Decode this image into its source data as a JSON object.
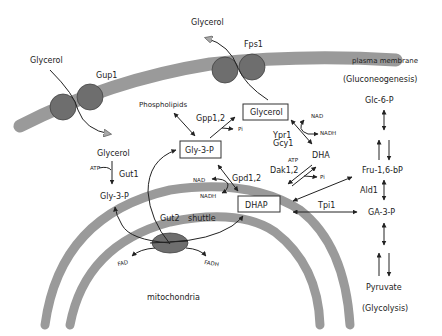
{
  "colors": {
    "membrane": "#9a9a9a",
    "protein": "#6e6e6e",
    "line": "#222222",
    "background": "#ffffff"
  },
  "labels": {
    "plasma_membrane": "plasma membrane",
    "gluconeogenesis": "(Gluconeogenesis)",
    "glycolysis": "(Glycolysis)",
    "mitochondria": "mitochondria",
    "glycerol_out_left": "Glycerol",
    "glycerol_out_top": "Glycerol",
    "glycerol_in_left": "Glycerol",
    "gup1": "Gup1",
    "fps1": "Fps1",
    "phospholipids": "Phospholipids",
    "gpp": "Gpp1,2",
    "pi_gpp": "Pi",
    "glycerol_box": "Glycerol",
    "gly3p_box": "Gly-3-P",
    "gly3p_left": "Gly-3-P",
    "gut1": "Gut1",
    "atp_gut1": "ATP",
    "gpd": "Gpd1,2",
    "nad_gpd": "NAD",
    "nadh_gpd": "NADH",
    "dhap_box": "DHAP",
    "ypr1": "Ypr1",
    "gcy1": "Gcy1",
    "nad_ypr": "NAD",
    "nadh_ypr": "NADH",
    "dha": "DHA",
    "atp_dak": "ATP",
    "dak": "Dak1,2",
    "pi_dak": "Pi",
    "tpi1": "Tpi1",
    "gut2": "Gut2",
    "shuttle": "shuttle",
    "fad": "FAD",
    "fadh": "FADH",
    "glc6p": "Glc-6-P",
    "fru16bp": "Fru-1,6-bP",
    "ald1": "Ald1",
    "ga3p": "GA-3-P",
    "pyruvate": "Pyruvate"
  }
}
